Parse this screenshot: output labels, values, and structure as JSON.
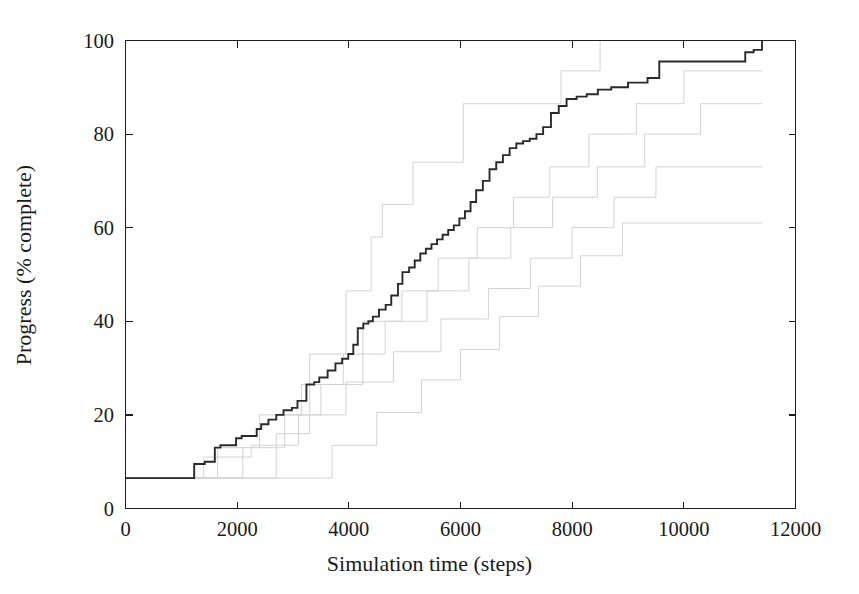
{
  "chart_data": {
    "type": "line",
    "subtype": "step",
    "title": "",
    "xlabel": "Simulation time (steps)",
    "ylabel": "Progress (% complete)",
    "xlim": [
      0,
      12000
    ],
    "ylim": [
      0,
      100
    ],
    "xticks": [
      0,
      2000,
      4000,
      6000,
      8000,
      10000,
      12000
    ],
    "xtick_labels": [
      "0",
      "2000",
      "4000",
      "6000",
      "8000",
      "10000",
      "12000"
    ],
    "yticks": [
      0,
      20,
      40,
      60,
      80,
      100
    ],
    "ytick_labels": [
      "0",
      "20",
      "40",
      "60",
      "80",
      "100"
    ],
    "grid": false,
    "legend": "none",
    "colors": {
      "mean_curve": "#2a2a2a",
      "individual_runs": "#d2d2d2",
      "axis": "#1d1d1d",
      "background": "#ffffff"
    },
    "series": [
      {
        "name": "mean progress",
        "style": "solid-dark-step",
        "color": "#2a2a2a",
        "x": [
          0,
          1180,
          1230,
          1420,
          1600,
          1700,
          1980,
          2080,
          2350,
          2430,
          2560,
          2700,
          2830,
          2980,
          3080,
          3240,
          3380,
          3470,
          3620,
          3760,
          3880,
          3990,
          4080,
          4160,
          4260,
          4350,
          4430,
          4540,
          4660,
          4760,
          4880,
          4960,
          5080,
          5180,
          5280,
          5380,
          5480,
          5580,
          5680,
          5780,
          5880,
          5980,
          6080,
          6180,
          6280,
          6400,
          6520,
          6640,
          6760,
          6880,
          7000,
          7120,
          7240,
          7360,
          7480,
          7620,
          7760,
          7900,
          8080,
          8260,
          8460,
          8700,
          9000,
          9350,
          9560,
          10400,
          11100,
          11250,
          11400
        ],
        "y": [
          6.5,
          6.5,
          9.5,
          10.0,
          13.0,
          13.5,
          15.0,
          15.5,
          17.0,
          18.0,
          19.0,
          20.0,
          21.0,
          21.5,
          23.0,
          26.5,
          27.0,
          28.0,
          29.5,
          31.0,
          32.0,
          33.0,
          35.0,
          38.5,
          39.5,
          40.0,
          41.0,
          42.5,
          43.5,
          45.5,
          48.0,
          50.5,
          51.5,
          53.0,
          54.5,
          55.5,
          56.5,
          57.5,
          58.5,
          59.5,
          60.5,
          62.0,
          63.5,
          65.5,
          68.0,
          70.0,
          72.5,
          74.0,
          75.5,
          77.0,
          78.0,
          78.5,
          79.0,
          80.0,
          81.5,
          84.5,
          86.0,
          87.5,
          88.0,
          88.5,
          89.5,
          90.0,
          91.0,
          92.0,
          95.5,
          95.5,
          97.5,
          98.0,
          100.0
        ]
      },
      {
        "name": "run fastest",
        "style": "light-step",
        "color": "#d2d2d2",
        "x": [
          0,
          2650,
          2700,
          3250,
          3300,
          3900,
          3950,
          4350,
          4400,
          4500,
          4600,
          4700,
          5150,
          5250,
          6050,
          6150,
          6900,
          7000,
          7800,
          7900,
          8400,
          8500,
          11400
        ],
        "y": [
          6.5,
          6.5,
          16.0,
          16.0,
          33.0,
          33.0,
          46.5,
          46.5,
          58.0,
          58.0,
          65.0,
          65.0,
          74.0,
          74.0,
          86.5,
          86.5,
          86.5,
          86.5,
          93.5,
          93.5,
          93.5,
          100.0,
          100.0
        ]
      },
      {
        "name": "run fast",
        "style": "light-step",
        "color": "#d2d2d2",
        "x": [
          0,
          2000,
          2100,
          2750,
          2850,
          3400,
          3500,
          4150,
          4250,
          4850,
          4950,
          5500,
          5600,
          6200,
          6300,
          6850,
          6950,
          7500,
          7600,
          8200,
          8300,
          9050,
          9150,
          9900,
          10000,
          11400
        ],
        "y": [
          6.5,
          6.5,
          13.0,
          13.0,
          20.0,
          20.0,
          26.5,
          26.5,
          40.0,
          40.0,
          46.5,
          46.5,
          53.5,
          53.5,
          60.0,
          60.0,
          66.5,
          66.5,
          73.0,
          73.0,
          80.0,
          80.0,
          86.5,
          86.5,
          93.5,
          93.5
        ]
      },
      {
        "name": "run median",
        "style": "light-step",
        "color": "#d2d2d2",
        "x": [
          0,
          1550,
          1650,
          2300,
          2400,
          3050,
          3150,
          3800,
          3900,
          4550,
          4650,
          5300,
          5400,
          6050,
          6150,
          6800,
          6900,
          7550,
          7650,
          8350,
          8450,
          9200,
          9300,
          10200,
          10300,
          11400
        ],
        "y": [
          6.5,
          6.5,
          13.0,
          13.0,
          20.0,
          20.0,
          26.5,
          26.5,
          33.0,
          33.0,
          40.0,
          40.0,
          46.5,
          46.5,
          53.5,
          53.5,
          60.0,
          60.0,
          66.5,
          66.5,
          73.0,
          73.0,
          80.0,
          80.0,
          86.5,
          86.5
        ]
      },
      {
        "name": "run slow",
        "style": "light-step",
        "color": "#d2d2d2",
        "x": [
          0,
          1300,
          1400,
          2150,
          2250,
          3000,
          3100,
          3850,
          3950,
          4700,
          4800,
          5550,
          5650,
          6400,
          6500,
          7150,
          7250,
          7900,
          8000,
          8650,
          8750,
          9400,
          9500,
          11400
        ],
        "y": [
          6.5,
          6.5,
          11.0,
          11.0,
          13.5,
          13.5,
          20.0,
          20.0,
          27.0,
          27.0,
          33.5,
          33.5,
          40.5,
          40.5,
          47.0,
          47.0,
          53.5,
          53.5,
          60.0,
          60.0,
          66.5,
          66.5,
          73.0,
          73.0
        ]
      },
      {
        "name": "run slowest",
        "style": "light-step",
        "color": "#d2d2d2",
        "x": [
          0,
          2500,
          2600,
          3600,
          3700,
          4400,
          4500,
          5200,
          5300,
          5900,
          6000,
          6600,
          6700,
          7300,
          7400,
          8050,
          8150,
          8800,
          8900,
          11400
        ],
        "y": [
          6.5,
          6.5,
          6.5,
          6.5,
          13.5,
          13.5,
          20.5,
          20.5,
          27.5,
          27.5,
          34.0,
          34.0,
          41.0,
          41.0,
          47.5,
          47.5,
          54.0,
          54.0,
          61.0,
          61.0
        ]
      }
    ]
  },
  "axes": {
    "x_title": "Simulation time (steps)",
    "y_title": "Progress (% complete)"
  }
}
